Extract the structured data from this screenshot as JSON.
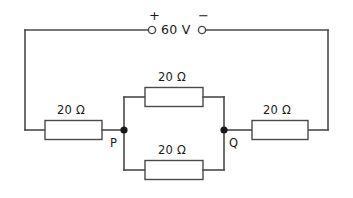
{
  "figure": {
    "colors": {
      "wire": "#4a4a4a",
      "node": "#1a1a1a",
      "text": "#1a1a1a",
      "background": "#ffffff"
    }
  },
  "source": {
    "voltage_label": "60 V",
    "positive_sign": "+",
    "negative_sign": "−"
  },
  "nodes": {
    "p_label": "P",
    "q_label": "Q"
  },
  "resistors": [
    {
      "id": "left",
      "label": "20 Ω",
      "value": 20,
      "unit": "Ω"
    },
    {
      "id": "middle-top",
      "label": "20 Ω",
      "value": 20,
      "unit": "Ω"
    },
    {
      "id": "middle-bottom",
      "label": "20 Ω",
      "value": 20,
      "unit": "Ω"
    },
    {
      "id": "right",
      "label": "20 Ω",
      "value": 20,
      "unit": "Ω"
    }
  ]
}
